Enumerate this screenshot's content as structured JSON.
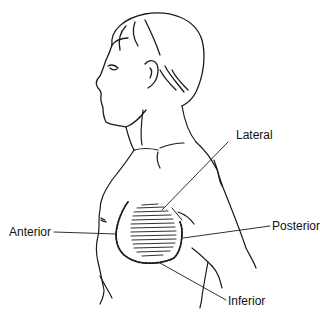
{
  "figure": {
    "labels": {
      "lateral": "Lateral",
      "anterior": "Anterior",
      "posterior": "Posterior",
      "inferior": "Inferior"
    }
  }
}
